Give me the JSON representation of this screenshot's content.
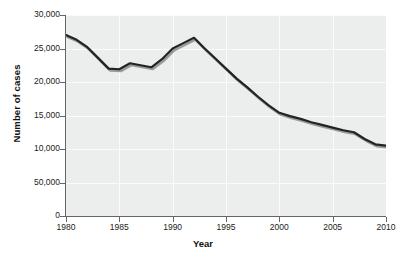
{
  "chart_data": {
    "type": "line",
    "title": "",
    "xlabel": "Year",
    "ylabel": "Number of cases",
    "xlim": [
      1980,
      2010
    ],
    "ylim": [
      0,
      30000
    ],
    "grid": true,
    "legend": null,
    "xtick_labels": [
      "1980",
      "1985",
      "1990",
      "1995",
      "2000",
      "2005",
      "2010"
    ],
    "xtick_values": [
      1980,
      1985,
      1990,
      1995,
      2000,
      2005,
      2010
    ],
    "ytick_labels": [
      "0",
      "50,000",
      "10,000",
      "15,000",
      "20,000",
      "25,000",
      "30,000"
    ],
    "ytick_values": [
      0,
      5000,
      10000,
      15000,
      20000,
      25000,
      30000
    ],
    "note_ytick_anomaly": "50,000",
    "x": [
      1980,
      1981,
      1982,
      1983,
      1984,
      1985,
      1986,
      1987,
      1988,
      1989,
      1990,
      1991,
      1992,
      1993,
      1994,
      1995,
      1996,
      1997,
      1998,
      1999,
      2000,
      2001,
      2002,
      2003,
      2004,
      2005,
      2006,
      2007,
      2008,
      2009,
      2010
    ],
    "values": [
      27000,
      26300,
      25200,
      23600,
      22000,
      21900,
      22800,
      22500,
      22200,
      23400,
      25000,
      25800,
      26600,
      25000,
      23500,
      22000,
      20500,
      19200,
      17800,
      16500,
      15400,
      14900,
      14500,
      14000,
      13600,
      13200,
      12800,
      12500,
      11500,
      10700,
      10500
    ],
    "series_color": "#232323",
    "shadow_color": "#9a9a9a",
    "plot_background": "#eceded",
    "gridline_color": "#fbfbfb"
  }
}
